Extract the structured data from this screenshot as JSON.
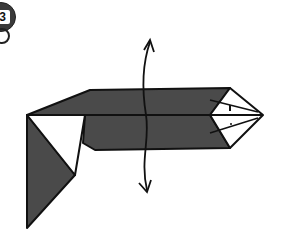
{
  "step": {
    "number": "3"
  },
  "colors": {
    "paper_dark": "#4a4a4a",
    "paper_light": "#ffffff",
    "line": "#111111"
  },
  "diagram": {
    "arrow": "turn-over"
  }
}
